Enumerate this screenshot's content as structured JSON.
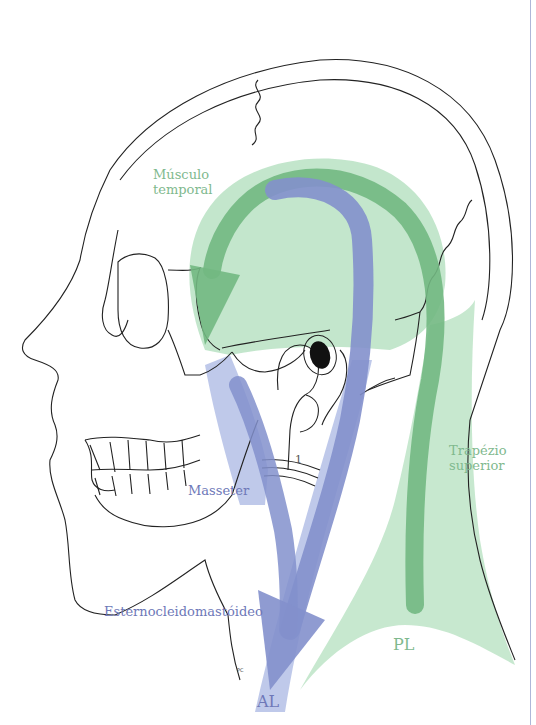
{
  "figure": {
    "labels": {
      "temporal": [
        "Músculo",
        "temporal"
      ],
      "trapezius": [
        "Trapézio",
        "superior"
      ],
      "masseter": "Masseter",
      "sternocleidomastoid": "Esternocleidomastóideo",
      "anterior_line": "AL",
      "posterior_line": "PL",
      "marker_1": "1",
      "pc_marker": "PC"
    },
    "colors": {
      "green_label": "#7fb98e",
      "blue_label": "#6e78b8",
      "green_muscle_fill": "#a9dcb6",
      "green_arrow": "#72b882",
      "blue_muscle_fill": "#aab7e3",
      "blue_arrow": "#8390cc",
      "outline": "#222222",
      "page_rule": "#aeb6d8"
    }
  }
}
